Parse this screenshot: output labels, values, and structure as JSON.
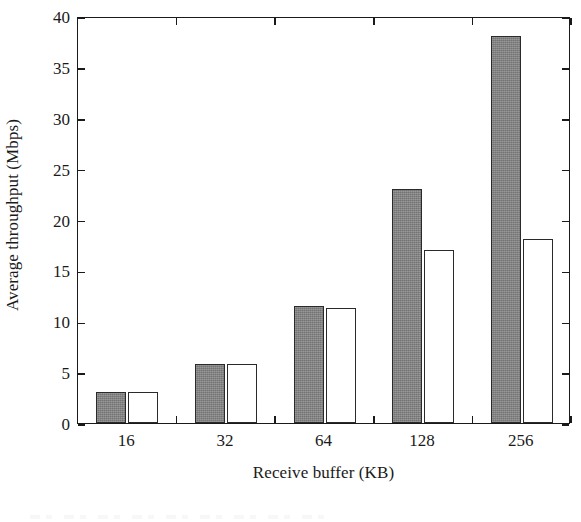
{
  "chart_data": {
    "type": "bar",
    "title": "",
    "subtitle": "",
    "xlabel": "Receive buffer (KB)",
    "ylabel": "Average throughput (Mbps)",
    "categories": [
      "16",
      "32",
      "64",
      "128",
      "256"
    ],
    "series": [
      {
        "name": "series-1-gray",
        "color": "#838383",
        "fill": "gray",
        "values": [
          3.0,
          5.8,
          11.5,
          23.0,
          38.0
        ]
      },
      {
        "name": "series-2-white",
        "color": "#ffffff",
        "fill": "white",
        "values": [
          3.0,
          5.8,
          11.3,
          17.0,
          18.1
        ]
      }
    ],
    "ylim": [
      0,
      40
    ],
    "ytick_values": [
      0,
      5,
      10,
      15,
      20,
      25,
      30,
      35,
      40
    ],
    "ytick_labels": [
      "0",
      "5",
      "10",
      "15",
      "20",
      "25",
      "30",
      "35",
      "40"
    ],
    "grid": false,
    "legend": "none",
    "frame": "box-all-sides-inward-ticks"
  }
}
